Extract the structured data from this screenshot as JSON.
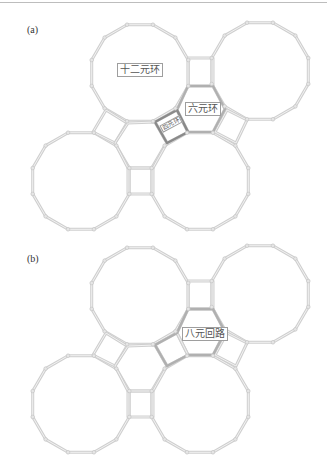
{
  "figure": {
    "panels": [
      {
        "id": "a",
        "label": "(a)",
        "ring_labels": {
          "twelve_ring": "十二元环",
          "six_ring": "六元环",
          "four_ring": "四元环"
        },
        "highlight": "四元环 (tilted square) and 六元环 (hexagon) outlined darker"
      },
      {
        "id": "b",
        "label": "(b)",
        "ring_labels": {
          "eight_path": "八元回路"
        },
        "highlight": "eight-membered circuit around hexagon + adjacent square"
      }
    ],
    "colors": {
      "edge": "#cfcfcf",
      "edge_inner": "#f2f2f2",
      "node": "#c4c4c4",
      "highlight_dark": "#8a8a8a",
      "highlight_mid": "#b0b0b0",
      "label_border": "#9e9e9e"
    }
  }
}
